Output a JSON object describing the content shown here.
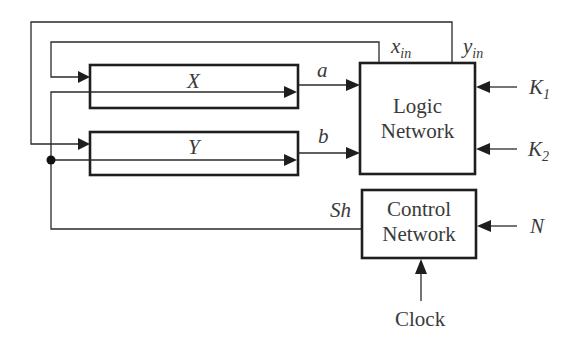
{
  "diagram": {
    "type": "block-diagram",
    "blocks": {
      "x_register": {
        "label": "X"
      },
      "y_register": {
        "label": "Y"
      },
      "logic_network": {
        "line1": "Logic",
        "line2": "Network"
      },
      "control_network": {
        "line1": "Control",
        "line2": "Network"
      }
    },
    "signals": {
      "a": "a",
      "b": "b",
      "x_in": {
        "base": "x",
        "sub": "in"
      },
      "y_in": {
        "base": "y",
        "sub": "in"
      },
      "k1": {
        "base": "K",
        "sub": "1"
      },
      "k2": {
        "base": "K",
        "sub": "2"
      },
      "n": "N",
      "sh": "Sh",
      "clock": "Clock"
    },
    "colors": {
      "line": "#1e1e1e",
      "text": "#3a3a3a",
      "background": "#ffffff"
    }
  }
}
